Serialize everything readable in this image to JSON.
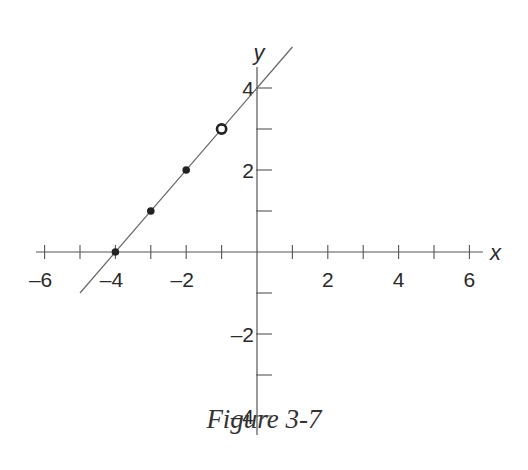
{
  "caption": "Figure 3-7",
  "chart_data": {
    "type": "line",
    "title": "Figure 3-7",
    "xlabel": "x",
    "ylabel": "y",
    "xlim": [
      -6.5,
      6.5
    ],
    "ylim": [
      -4.5,
      5
    ],
    "grid": false,
    "x_ticks": [
      -6,
      -5,
      -4,
      -3,
      -2,
      -1,
      1,
      2,
      3,
      4,
      5,
      6
    ],
    "x_tick_labels": [
      "-6",
      "-4",
      "-2",
      "2",
      "4",
      "6"
    ],
    "x_tick_label_values": [
      -6,
      -4,
      -2,
      2,
      4,
      6
    ],
    "y_ticks": [
      -4,
      -3,
      -2,
      -1,
      1,
      2,
      3,
      4
    ],
    "y_tick_labels": [
      "4",
      "2",
      "-2",
      "-4"
    ],
    "y_tick_label_values": [
      4,
      2,
      -2,
      -4
    ],
    "series": [
      {
        "name": "line y = x + 4",
        "kind": "line",
        "x": [
          -5.0,
          1.0
        ],
        "y": [
          -1.0,
          5.0
        ]
      },
      {
        "name": "filled points",
        "kind": "scatter",
        "marker": "filled-circle",
        "x": [
          -4,
          -3,
          -2
        ],
        "y": [
          0,
          1,
          2
        ]
      },
      {
        "name": "open point",
        "kind": "scatter",
        "marker": "open-circle",
        "x": [
          -1
        ],
        "y": [
          3
        ]
      }
    ]
  },
  "colors": {
    "axis": "#555555",
    "line": "#666666",
    "point": "#222222",
    "text": "#2a2a2a"
  }
}
